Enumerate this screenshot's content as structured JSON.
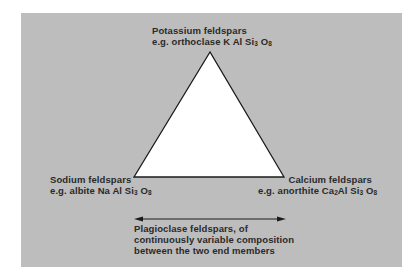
{
  "colors": {
    "panel": "#bdbdbd",
    "triangle_fill": "#ffffff",
    "stroke": "#1a1a1a",
    "text": "#2a2a2a"
  },
  "vertices": {
    "top": {
      "title": "Potassium feldspars",
      "example_prefix": "e.g. orthoclase K Al Si",
      "si_sub": "3",
      "o": " O",
      "o_sub": "8"
    },
    "left": {
      "title": "Sodium feldspars",
      "example_prefix": "e.g. albite Na Al Si",
      "si_sub": "3",
      "o": " O",
      "o_sub": "8"
    },
    "right": {
      "title": "Calcium feldspars",
      "example_prefix": "e.g. anorthite Ca",
      "ca_sub": "2",
      "mid": "Al Si",
      "si_sub": "3",
      "o": " O",
      "o_sub": "8"
    }
  },
  "plagioclase": {
    "line1": "Plagioclase feldspars, of",
    "line2": "continuously variable composition",
    "line3": "between the two end members"
  }
}
